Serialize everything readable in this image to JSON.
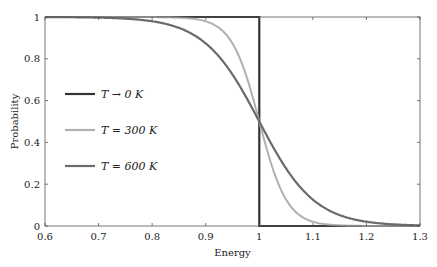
{
  "chart_data": {
    "type": "line",
    "title": "",
    "xlabel": "Energy",
    "ylabel": "Probability",
    "xlim": [
      0.6,
      1.3
    ],
    "ylim": [
      0,
      1
    ],
    "xticks": [
      0.6,
      0.7,
      0.8,
      0.9,
      1.0,
      1.1,
      1.2,
      1.3
    ],
    "xtick_labels": [
      "0.6",
      "0.7",
      "0.8",
      "0.9",
      "1",
      "1.1",
      "1.2",
      "1.3"
    ],
    "yticks": [
      0,
      0.2,
      0.4,
      0.6,
      0.8,
      1.0
    ],
    "ytick_labels": [
      "0",
      "0.2",
      "0.4",
      "0.6",
      "0.8",
      "1"
    ],
    "grid": false,
    "legend_position": "center-left",
    "function": "Fermi-Dirac: 1 / (1 + exp((E - 1) / kT))",
    "series": [
      {
        "name": "T → 0 K",
        "color": "#333333",
        "kT": 0,
        "x": [
          0.6,
          1.0,
          1.0,
          1.3
        ],
        "y": [
          1,
          1,
          0,
          0
        ]
      },
      {
        "name": "T = 300 K",
        "color": "#b0b0b0",
        "kT": 0.0259,
        "x": [
          0.6,
          0.8,
          0.9,
          0.95,
          1.0,
          1.05,
          1.1,
          1.2,
          1.3
        ],
        "y": [
          1.0,
          1.0,
          0.979,
          0.873,
          0.5,
          0.127,
          0.021,
          0.0004,
          0.0
        ]
      },
      {
        "name": "T = 600 K",
        "color": "#6b6b6b",
        "kT": 0.0517,
        "x": [
          0.6,
          0.7,
          0.8,
          0.9,
          0.95,
          1.0,
          1.05,
          1.1,
          1.2,
          1.3
        ],
        "y": [
          0.9996,
          0.997,
          0.979,
          0.874,
          0.725,
          0.5,
          0.275,
          0.126,
          0.02,
          0.003
        ]
      }
    ]
  }
}
